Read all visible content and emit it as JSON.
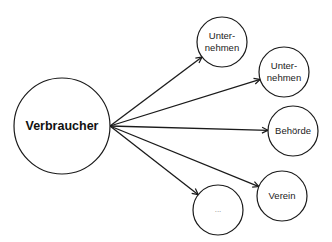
{
  "diagram": {
    "type": "hub-and-spoke",
    "center": {
      "label": "Verbraucher",
      "cx": 62,
      "cy": 126,
      "r": 48
    },
    "nodes": [
      {
        "label": "Unter-\nnehmen",
        "cx": 222,
        "cy": 42,
        "r": 25
      },
      {
        "label": "Unter-\nnehmen",
        "cx": 284,
        "cy": 72,
        "r": 25
      },
      {
        "label": "Behörde",
        "cx": 293,
        "cy": 131,
        "r": 25
      },
      {
        "label": "Verein",
        "cx": 282,
        "cy": 196,
        "r": 25
      },
      {
        "label": "...",
        "cx": 218,
        "cy": 210,
        "r": 25
      }
    ],
    "colors": {
      "stroke": "#1a1a1a",
      "fill": "#ffffff"
    }
  }
}
